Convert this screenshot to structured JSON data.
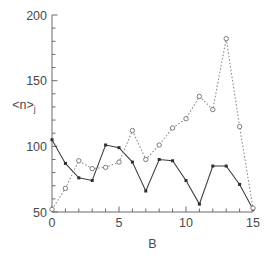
{
  "chart_data": {
    "type": "line",
    "title": "",
    "subtitle": "",
    "xlabel": "B",
    "ylabel": "<n>j",
    "ylabel_base": "<n>",
    "ylabel_sub": "j",
    "xlim": [
      0,
      15
    ],
    "ylim": [
      50,
      200
    ],
    "x": [
      0,
      1,
      2,
      3,
      4,
      5,
      6,
      7,
      8,
      9,
      10,
      11,
      12,
      13,
      14,
      15
    ],
    "xticks": [
      0,
      5,
      10,
      15
    ],
    "xtick_labels": [
      "0",
      "5",
      "10",
      "15"
    ],
    "xminor_step": 1,
    "yticks": [
      50,
      100,
      150,
      200
    ],
    "ytick_labels": [
      "50",
      "100",
      "150",
      "200"
    ],
    "yminor_step": 10,
    "grid": false,
    "legend": "none",
    "series": [
      {
        "name": "solid",
        "style": "solid",
        "marker": "filled-square",
        "color": "#3a3a3a",
        "values": [
          105,
          87,
          76,
          74,
          101,
          99,
          88,
          66,
          90,
          89,
          74,
          56,
          85,
          85,
          71,
          52
        ]
      },
      {
        "name": "dotted",
        "style": "dotted",
        "marker": "open-circle",
        "color": "#8a8a8a",
        "values": [
          52,
          68,
          89,
          83,
          84,
          88,
          112,
          90,
          101,
          114,
          121,
          138,
          128,
          182,
          115,
          53
        ]
      }
    ]
  },
  "colors": {
    "background": "#ffffff",
    "axis": "#6b6b6b",
    "text": "#4a4a4a",
    "series_solid": "#3a3a3a",
    "series_dotted": "#8a8a8a"
  }
}
